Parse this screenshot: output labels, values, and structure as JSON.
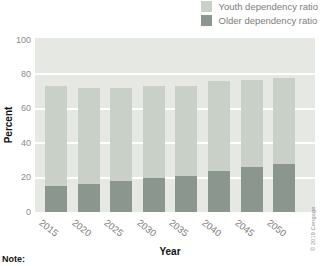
{
  "legend": {
    "items": [
      {
        "label": "Youth dependency ratio",
        "color": "#c9d0c7"
      },
      {
        "label": "Older dependency ratio",
        "color": "#8b968f"
      }
    ]
  },
  "chart_data": {
    "type": "bar",
    "stacked": true,
    "categories": [
      "2015",
      "2020",
      "2025",
      "2030",
      "2035",
      "2040",
      "2045",
      "2050"
    ],
    "series": [
      {
        "name": "Older dependency ratio",
        "color": "#8b968f",
        "values": [
          15,
          16,
          18,
          20,
          21,
          24,
          26,
          28
        ]
      },
      {
        "name": "Youth dependency ratio",
        "color": "#c9d0c7",
        "values": [
          58,
          56,
          54,
          53,
          52,
          52,
          51,
          50
        ]
      }
    ],
    "totals": [
      73,
      72,
      72,
      73,
      73,
      76,
      77,
      78
    ],
    "xlabel": "Year",
    "ylabel": "Percent",
    "ylim": [
      0,
      100
    ],
    "yticks": [
      0,
      20,
      40,
      60,
      80,
      100
    ],
    "gridline_values": [
      20,
      40,
      60,
      80
    ],
    "grid": true,
    "plot_background": "#e6e8e4",
    "gridline_color": "#ffffff",
    "legend_position": "top-right"
  },
  "footer": {
    "note_label": "Note:"
  },
  "credit": "© 2019 Cengage"
}
